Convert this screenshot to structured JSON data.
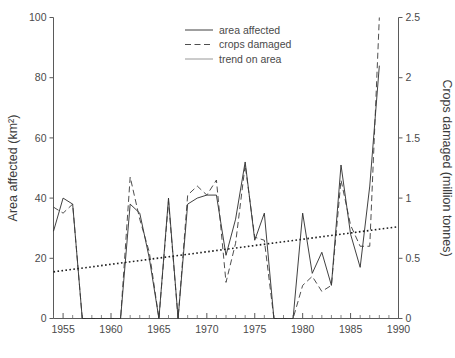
{
  "chart_data": {
    "type": "line",
    "title": "",
    "xlabel": "",
    "ylabel": "Area affected (km²)",
    "y2label": "Crops damaged (million tonnes)",
    "xlim": [
      1954,
      1990
    ],
    "ylim": [
      0,
      100
    ],
    "y2lim": [
      0,
      2.5
    ],
    "grid": false,
    "legend_position": "top-center",
    "x_ticks": [
      "1955",
      "1960",
      "1965",
      "1970",
      "1975",
      "1980",
      "1985",
      "1990"
    ],
    "x_tick_values": [
      1955,
      1960,
      1965,
      1970,
      1975,
      1980,
      1985,
      1990
    ],
    "x_minor_step": 1,
    "y_ticks": [
      "0",
      "20",
      "40",
      "60",
      "80",
      "100"
    ],
    "y_tick_values": [
      0,
      20,
      40,
      60,
      80,
      100
    ],
    "y2_ticks": [
      "0",
      "0.5",
      "1",
      "1.5",
      "2",
      "2.5"
    ],
    "y2_tick_values": [
      0,
      0.5,
      1,
      1.5,
      2,
      2.5
    ],
    "x": [
      1954,
      1955,
      1956,
      1957,
      1958,
      1959,
      1960,
      1961,
      1962,
      1963,
      1964,
      1965,
      1966,
      1967,
      1968,
      1969,
      1970,
      1971,
      1972,
      1973,
      1974,
      1975,
      1976,
      1977,
      1978,
      1979,
      1980,
      1981,
      1982,
      1983,
      1984,
      1985,
      1986,
      1987,
      1988
    ],
    "series": [
      {
        "name": "area affected",
        "style": "solid",
        "axis": "left",
        "units": "km²",
        "values": [
          29,
          40,
          38,
          0,
          0,
          0,
          0,
          0,
          38,
          35,
          20,
          0,
          40,
          0,
          38,
          40,
          41,
          41,
          21,
          33,
          52,
          26,
          35,
          0,
          0,
          0,
          35,
          15,
          22,
          11,
          51,
          28,
          17,
          44,
          84
        ]
      },
      {
        "name": "crops damaged",
        "style": "dashed",
        "axis": "right",
        "units": "million tonnes",
        "values_left_scale": [
          37,
          35,
          38,
          0,
          0,
          0,
          0,
          0,
          47,
          33,
          22,
          0,
          39,
          0,
          41,
          44,
          41,
          46,
          12,
          25,
          51,
          27,
          26,
          0,
          0,
          0,
          11,
          14,
          9,
          11,
          46,
          31,
          24,
          24,
          100
        ],
        "values": [
          0.93,
          0.88,
          0.95,
          0.0,
          0.0,
          0.0,
          0.0,
          0.0,
          1.18,
          0.83,
          0.55,
          0.0,
          0.98,
          0.0,
          1.03,
          1.1,
          1.03,
          1.15,
          0.3,
          0.63,
          1.28,
          0.68,
          0.65,
          0.0,
          0.0,
          0.0,
          0.28,
          0.35,
          0.23,
          0.28,
          1.15,
          0.78,
          0.6,
          0.6,
          2.5
        ]
      },
      {
        "name": "trend on area",
        "style": "dotted",
        "axis": "left",
        "endpoints": [
          {
            "x": 1954,
            "y": 15.5
          },
          {
            "x": 1990,
            "y": 30.5
          }
        ]
      }
    ],
    "legend": [
      {
        "label": "area affected",
        "style": "solid"
      },
      {
        "label": "crops damaged",
        "style": "dashed"
      },
      {
        "label": "trend on area",
        "style": "solid-light"
      }
    ]
  }
}
